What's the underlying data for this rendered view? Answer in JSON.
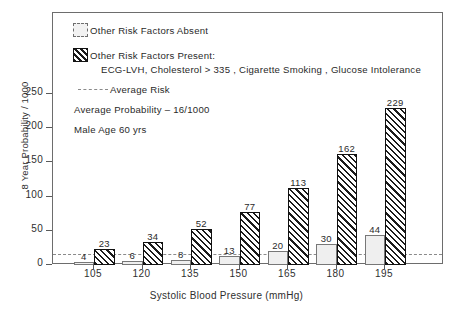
{
  "chart_data": {
    "type": "bar",
    "title": "",
    "xlabel": "Systolic Blood Pressure (mmHg)",
    "ylabel": "8 Year Probability / 1000",
    "categories": [
      "105",
      "120",
      "135",
      "150",
      "165",
      "180",
      "195"
    ],
    "series": [
      {
        "name": "Other Risk Factors Absent",
        "values": [
          4,
          6,
          8,
          13,
          20,
          30,
          44
        ]
      },
      {
        "name": "Other Risk Factors Present",
        "values": [
          23,
          34,
          52,
          77,
          113,
          162,
          229
        ]
      }
    ],
    "ylim": [
      0,
      280
    ],
    "yticks": [
      0,
      50,
      100,
      150,
      200,
      250
    ],
    "ytick_labels": [
      "0",
      "50",
      "100",
      "150",
      "200",
      "250"
    ],
    "grid": false,
    "legend_position": "upper-left",
    "annotations": {
      "average_risk_value": 16,
      "average_risk_label": "Average Risk"
    }
  },
  "legend": {
    "absent_label": "Other Risk Factors Absent",
    "present_label": "Other Risk Factors Present:",
    "present_detail": "ECG-LVH, Cholesterol > 335 , Cigarette Smoking , Glucose Intolerance",
    "average_risk_label": "Average Risk",
    "note_probability": "Average Probability – 16/1000",
    "note_subject": "Male Age 60 yrs"
  },
  "axes": {
    "y_title": "8 Year Probability / 1000",
    "x_title": "Systolic Blood Pressure (mmHg)"
  },
  "colors": {
    "frame": "#6d6d6d",
    "bar_absent_fill": "#efefef",
    "bar_present_hatch": "#1b1b1b",
    "average_line": "#8a8a8a",
    "text": "#2a2a2a"
  }
}
